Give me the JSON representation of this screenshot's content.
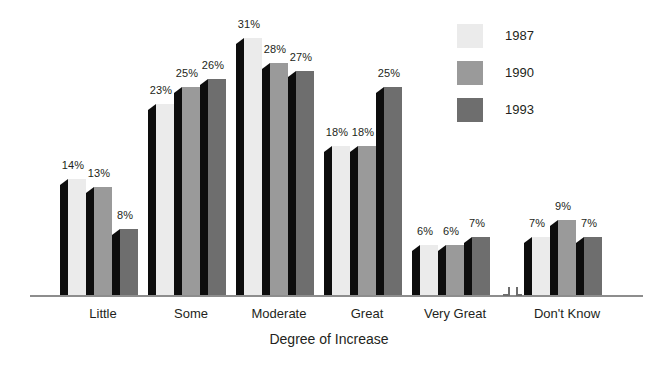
{
  "chart_data": {
    "type": "bar",
    "title": "",
    "subtitle": "",
    "xlabel": "Degree of Increase",
    "ylabel": "",
    "ylim": [
      0,
      31
    ],
    "grid": false,
    "legend_position": "right",
    "axis_break": true,
    "axis_break_between": [
      "Very Great",
      "Don't Know"
    ],
    "categories": [
      "Little",
      "Some",
      "Moderate",
      "Great",
      "Very Great",
      "Don't Know"
    ],
    "series": [
      {
        "name": "1987",
        "color": "#ebebeb",
        "values": [
          14,
          13,
          8,
          0,
          0,
          0
        ],
        "labels": [
          "14%",
          "13%",
          "8%",
          "",
          "",
          ""
        ]
      },
      {
        "name": "1990",
        "color": "#9a9a9a",
        "values": [
          23,
          25,
          26,
          0,
          0,
          0
        ],
        "labels": [
          "23%",
          "25%",
          "26%",
          "",
          "",
          ""
        ]
      },
      {
        "name": "1993",
        "color": "#6e6e6e",
        "values": [
          31,
          28,
          27,
          0,
          0,
          0
        ],
        "labels": [
          "31%",
          "28%",
          "27%",
          "",
          "",
          ""
        ]
      }
    ],
    "groups": [
      {
        "category": "Little",
        "bars": [
          {
            "series": "1987",
            "value": 14,
            "label": "14%",
            "color": "#ebebeb"
          },
          {
            "series": "1990",
            "value": 13,
            "label": "13%",
            "color": "#9a9a9a"
          },
          {
            "series": "1993",
            "value": 8,
            "label": "8%",
            "color": "#6e6e6e"
          }
        ]
      },
      {
        "category": "Some",
        "bars": [
          {
            "series": "1987",
            "value": 23,
            "label": "23%",
            "color": "#ebebeb"
          },
          {
            "series": "1990",
            "value": 25,
            "label": "25%",
            "color": "#9a9a9a"
          },
          {
            "series": "1993",
            "value": 26,
            "label": "26%",
            "color": "#6e6e6e"
          }
        ]
      },
      {
        "category": "Moderate",
        "bars": [
          {
            "series": "1987",
            "value": 31,
            "label": "31%",
            "color": "#ebebeb"
          },
          {
            "series": "1990",
            "value": 28,
            "label": "28%",
            "color": "#9a9a9a"
          },
          {
            "series": "1993",
            "value": 27,
            "label": "27%",
            "color": "#6e6e6e"
          }
        ]
      },
      {
        "category": "Great",
        "bars": [
          {
            "series": "1987",
            "value": 18,
            "label": "18%",
            "color": "#ebebeb"
          },
          {
            "series": "1990",
            "value": 18,
            "label": "18%",
            "color": "#9a9a9a"
          },
          {
            "series": "1993",
            "value": 25,
            "label": "25%",
            "color": "#6e6e6e"
          }
        ]
      },
      {
        "category": "Very Great",
        "bars": [
          {
            "series": "1987",
            "value": 6,
            "label": "6%",
            "color": "#ebebeb"
          },
          {
            "series": "1990",
            "value": 6,
            "label": "6%",
            "color": "#9a9a9a"
          },
          {
            "series": "1993",
            "value": 7,
            "label": "7%",
            "color": "#6e6e6e"
          }
        ]
      },
      {
        "category": "Don't Know",
        "bars": [
          {
            "series": "1987",
            "value": 7,
            "label": "7%",
            "color": "#ebebeb"
          },
          {
            "series": "1990",
            "value": 9,
            "label": "9%",
            "color": "#9a9a9a"
          },
          {
            "series": "1993",
            "value": 7,
            "label": "7%",
            "color": "#6e6e6e"
          }
        ]
      }
    ]
  },
  "legend": {
    "items": [
      {
        "label": "1987",
        "color": "#ebebeb"
      },
      {
        "label": "1990",
        "color": "#9a9a9a"
      },
      {
        "label": "1993",
        "color": "#6e6e6e"
      }
    ]
  },
  "axis": {
    "x_title": "Degree of Increase"
  },
  "colors": {
    "series_1987": "#ebebeb",
    "series_1990": "#9a9a9a",
    "series_1993": "#6e6e6e",
    "bar_side_face": "#0d0d0d",
    "axis_line": "#8d8d8d",
    "text": "#231f20",
    "background": "#ffffff"
  }
}
